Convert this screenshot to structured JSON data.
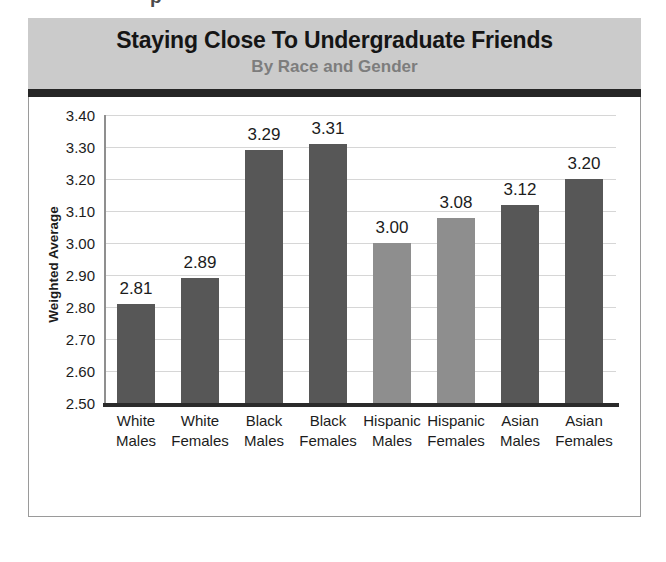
{
  "top_fragment": "p",
  "header": {
    "title": "Staying Close To Undergraduate Friends",
    "subtitle": "By Race and Gender",
    "banner_color": "#cbcbcb",
    "rule_color": "#262626",
    "title_color": "#151515",
    "subtitle_color": "#7d7d7d"
  },
  "chart_data": {
    "type": "bar",
    "title": "Staying Close To Undergraduate Friends",
    "subtitle": "By Race and Gender",
    "xlabel": "",
    "ylabel": "Weighted Average",
    "ylim": [
      2.5,
      3.4
    ],
    "ytick_step": 0.1,
    "yticks": [
      "3.40",
      "3.30",
      "3.20",
      "3.10",
      "3.00",
      "2.90",
      "2.80",
      "2.70",
      "2.60",
      "2.50"
    ],
    "grid": true,
    "legend": "none",
    "categories": [
      "White Males",
      "White Females",
      "Black Males",
      "Black Females",
      "Hispanic Males",
      "Hispanic Females",
      "Asian Males",
      "Asian Females"
    ],
    "category_lines": [
      [
        "White",
        "Males"
      ],
      [
        "White",
        "Females"
      ],
      [
        "Black",
        "Males"
      ],
      [
        "Black",
        "Females"
      ],
      [
        "Hispanic",
        "Males"
      ],
      [
        "Hispanic",
        "Females"
      ],
      [
        "Asian",
        "Males"
      ],
      [
        "Asian",
        "Females"
      ]
    ],
    "values": [
      2.81,
      2.89,
      3.29,
      3.31,
      3.0,
      3.08,
      3.12,
      3.2
    ],
    "value_labels": [
      "2.81",
      "2.89",
      "3.29",
      "3.31",
      "3.00",
      "3.08",
      "3.12",
      "3.20"
    ],
    "bar_colors": [
      "#575757",
      "#575757",
      "#575757",
      "#575757",
      "#8e8e8e",
      "#8e8e8e",
      "#575757",
      "#575757"
    ]
  }
}
